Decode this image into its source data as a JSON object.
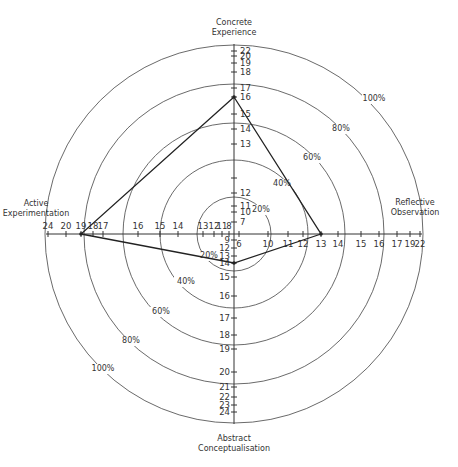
{
  "chart_data": {
    "type": "radar",
    "title": "",
    "center": [
      234,
      234
    ],
    "rings": [
      {
        "label": "20%",
        "radius": 37
      },
      {
        "label": "40%",
        "radius": 74
      },
      {
        "label": "60%",
        "radius": 111
      },
      {
        "label": "80%",
        "radius": 150
      },
      {
        "label": "100%",
        "radius": 189
      }
    ],
    "axes": [
      {
        "name": "Concrete Experience",
        "direction": "up",
        "label_lines": [
          "Concrete",
          "Experience"
        ],
        "ticks": [
          {
            "v": "7",
            "r": 12,
            "show": true
          },
          {
            "v": "10",
            "r": 22,
            "show": true
          },
          {
            "v": "11",
            "r": 28,
            "show": true
          },
          {
            "v": "12",
            "r": 41,
            "show": true
          },
          {
            "v": "",
            "r": 56,
            "show": false
          },
          {
            "v": "13",
            "r": 90,
            "show": true
          },
          {
            "v": "14",
            "r": 105,
            "show": true
          },
          {
            "v": "15",
            "r": 120,
            "show": true
          },
          {
            "v": "16",
            "r": 137,
            "show": true
          },
          {
            "v": "17",
            "r": 146,
            "show": true
          },
          {
            "v": "18",
            "r": 162,
            "show": true
          },
          {
            "v": "19",
            "r": 171,
            "show": true
          },
          {
            "v": "20",
            "r": 178,
            "show": true
          },
          {
            "v": "22",
            "r": 183,
            "show": true
          }
        ]
      },
      {
        "name": "Reflective Observation",
        "direction": "right",
        "label_lines": [
          "Reflective",
          "Observation"
        ],
        "ticks": [
          {
            "v": "6",
            "r": 5,
            "show": true
          },
          {
            "v": "10",
            "r": 34,
            "show": true
          },
          {
            "v": "11",
            "r": 54,
            "show": true
          },
          {
            "v": "12",
            "r": 69,
            "show": true
          },
          {
            "v": "13",
            "r": 87,
            "show": true
          },
          {
            "v": "14",
            "r": 104,
            "show": true
          },
          {
            "v": "15",
            "r": 127,
            "show": true
          },
          {
            "v": "16",
            "r": 145,
            "show": true
          },
          {
            "v": "17",
            "r": 163,
            "show": true
          },
          {
            "v": "19",
            "r": 176,
            "show": true
          },
          {
            "v": "22",
            "r": 186,
            "show": true
          }
        ]
      },
      {
        "name": "Abstract Conceptualisation",
        "direction": "down",
        "label_lines": [
          "Abstract",
          "Conceptualisation"
        ],
        "ticks": [
          {
            "v": "9",
            "r": 6,
            "show": true
          },
          {
            "v": "12",
            "r": 14,
            "show": true
          },
          {
            "v": "13",
            "r": 22,
            "show": true
          },
          {
            "v": "14",
            "r": 29,
            "show": true
          },
          {
            "v": "15",
            "r": 43,
            "show": true
          },
          {
            "v": "16",
            "r": 62,
            "show": true
          },
          {
            "v": "17",
            "r": 84,
            "show": true
          },
          {
            "v": "18",
            "r": 101,
            "show": true
          },
          {
            "v": "19",
            "r": 115,
            "show": true
          },
          {
            "v": "20",
            "r": 138,
            "show": true
          },
          {
            "v": "21",
            "r": 153,
            "show": true
          },
          {
            "v": "22",
            "r": 163,
            "show": true
          },
          {
            "v": "23",
            "r": 171,
            "show": true
          },
          {
            "v": "24",
            "r": 178,
            "show": true
          }
        ]
      },
      {
        "name": "Active Experimentation",
        "direction": "left",
        "label_lines": [
          "Active",
          "Experimentation"
        ],
        "ticks": [
          {
            "v": "8",
            "r": 5,
            "show": true
          },
          {
            "v": "11",
            "r": 12,
            "show": true
          },
          {
            "v": "12",
            "r": 20,
            "show": true
          },
          {
            "v": "13",
            "r": 31,
            "show": true
          },
          {
            "v": "14",
            "r": 56,
            "show": true
          },
          {
            "v": "15",
            "r": 74,
            "show": true
          },
          {
            "v": "16",
            "r": 96,
            "show": true
          },
          {
            "v": "17",
            "r": 131,
            "show": true
          },
          {
            "v": "18",
            "r": 141,
            "show": true
          },
          {
            "v": "19",
            "r": 153,
            "show": true
          },
          {
            "v": "20",
            "r": 168,
            "show": true
          },
          {
            "v": "24",
            "r": 186,
            "show": true
          }
        ]
      }
    ],
    "series": [
      {
        "name": "Learning style profile",
        "values": {
          "Concrete Experience": 16,
          "Reflective Observation": 13,
          "Abstract Conceptualisation": 14,
          "Active Experimentation": 19
        },
        "radii": {
          "up": 137,
          "right": 87,
          "down": 29,
          "left": 153
        }
      }
    ],
    "ring_label_positions": [
      {
        "label": "20%",
        "x": 261,
        "y": 212
      },
      {
        "label": "40%",
        "x": 282,
        "y": 186
      },
      {
        "label": "60%",
        "x": 312,
        "y": 160
      },
      {
        "label": "80%",
        "x": 341,
        "y": 131
      },
      {
        "label": "100%",
        "x": 374,
        "y": 101
      },
      {
        "label": "20%",
        "x": 209,
        "y": 258
      },
      {
        "label": "40%",
        "x": 186,
        "y": 284
      },
      {
        "label": "60%",
        "x": 161,
        "y": 314
      },
      {
        "label": "80%",
        "x": 131,
        "y": 343
      },
      {
        "label": "100%",
        "x": 103,
        "y": 371
      }
    ],
    "grid": false,
    "legend": null
  }
}
